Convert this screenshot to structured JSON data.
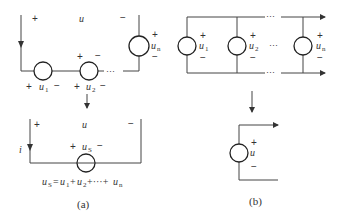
{
  "figure": {
    "part_a": {
      "caption": "(a)",
      "top_circuit": {
        "terminal_voltage": {
          "plus": "+",
          "name": "u",
          "minus": "−"
        },
        "sources": [
          {
            "name": "u",
            "sub": "1",
            "plus": "+",
            "minus": "−"
          },
          {
            "name": "u",
            "sub": "2",
            "plus": "+",
            "minus": "−"
          },
          {
            "name": "u",
            "sub": "n",
            "plus": "+",
            "minus": "−"
          }
        ],
        "ellipsis": "···"
      },
      "bottom_circuit": {
        "terminal_voltage": {
          "plus": "+",
          "name": "u",
          "minus": "−"
        },
        "current": "i",
        "source": {
          "name": "u",
          "sub": "S",
          "plus": "+",
          "minus": "−"
        },
        "equation": {
          "lhs": "u",
          "lhs_sub": "S",
          "eq": "=",
          "t1": "u",
          "t1_sub": "1",
          "plus1": "+",
          "t2": "u",
          "t2_sub": "2",
          "plus2": "+···+",
          "tn": "u",
          "tn_sub": "n"
        }
      }
    },
    "part_b": {
      "caption": "(b)",
      "parallel_circuit": {
        "sources": [
          {
            "name": "u",
            "sub": "1",
            "plus": "+",
            "minus": "−"
          },
          {
            "name": "u",
            "sub": "2",
            "plus": "+",
            "minus": "−"
          },
          {
            "name": "u",
            "sub": "n",
            "plus": "+",
            "minus": "−"
          }
        ],
        "ellipsis": "···"
      },
      "equivalent_circuit": {
        "source": {
          "name": "u",
          "plus": "+",
          "minus": "−"
        }
      }
    }
  }
}
